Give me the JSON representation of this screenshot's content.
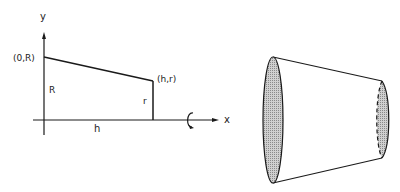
{
  "diagram": {
    "left_panel": {
      "axis_y_label": "y",
      "axis_x_label": "x",
      "point_start_label": "(0,R)",
      "point_end_label": "(h,r)",
      "height_R_label": "R",
      "height_r_label": "r",
      "length_h_label": "h",
      "rotation_icon": "rotate-around-x-axis"
    },
    "right_panel": {
      "shape": "truncated cone (frustum) generated by revolving the segment about the x-axis",
      "face_fill": "#bdbdbd"
    },
    "colors": {
      "line": "#1a1a1a",
      "background": "#ffffff"
    }
  }
}
